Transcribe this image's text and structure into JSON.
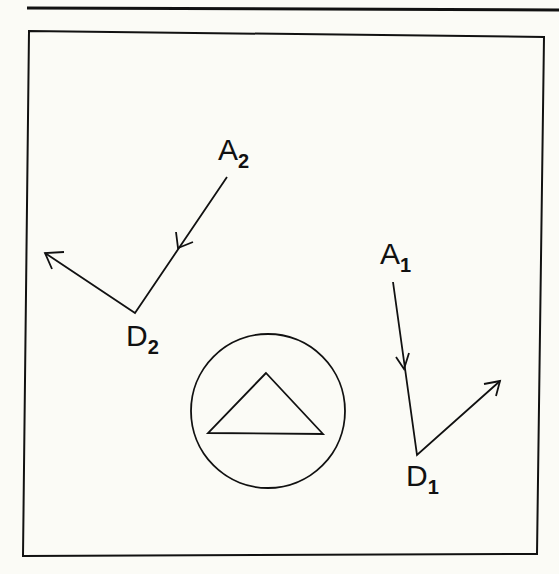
{
  "figure": {
    "stroke_color": "#111111",
    "background": "#fbfbf6",
    "labels": {
      "a2": {
        "main": "A",
        "sub": "2"
      },
      "d2": {
        "main": "D",
        "sub": "2"
      },
      "a1": {
        "main": "A",
        "sub": "1"
      },
      "d1": {
        "main": "D",
        "sub": "1"
      }
    },
    "paths": {
      "path2": {
        "start": [
          227,
          177
        ],
        "vertex": [
          135,
          313
        ],
        "end": [
          45,
          253
        ]
      },
      "path1": {
        "start": [
          393,
          282
        ],
        "vertex": [
          417,
          455
        ],
        "end": [
          500,
          381
        ]
      }
    },
    "center_symbol": {
      "shape": "circle-with-triangle",
      "circle": {
        "cx": 268,
        "cy": 411,
        "r": 77
      },
      "triangle": [
        [
          266,
          373
        ],
        [
          208,
          433
        ],
        [
          323,
          434
        ]
      ]
    }
  }
}
